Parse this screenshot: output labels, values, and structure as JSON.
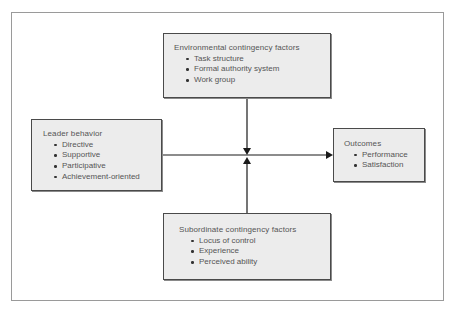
{
  "diagram": {
    "type": "path-goal-model",
    "boxes": {
      "environmental": {
        "title": "Environmental contingency factors",
        "items": [
          "Task structure",
          "Formal authority system",
          "Work group"
        ]
      },
      "leader": {
        "title": "Leader behavior",
        "items": [
          "Directive",
          "Supportive",
          "Participative",
          "Achievement-oriented"
        ]
      },
      "outcomes": {
        "title": "Outcomes",
        "items": [
          "Performance",
          "Satisfaction"
        ]
      },
      "subordinate": {
        "title": "Subordinate contingency factors",
        "items": [
          "Locus of control",
          "Experience",
          "Perceived ability"
        ]
      }
    },
    "connections": [
      {
        "from": "leader",
        "to": "outcomes",
        "style": "arrow"
      },
      {
        "from": "environmental",
        "to": "leader-outcomes-line",
        "style": "arrow-down"
      },
      {
        "from": "subordinate",
        "to": "leader-outcomes-line",
        "style": "arrow-up"
      }
    ],
    "colors": {
      "box_fill": "#ececec",
      "box_border": "#4a4a4a",
      "line": "#1a1a1a",
      "text": "#555555",
      "frame": "#9a9a9a"
    }
  }
}
